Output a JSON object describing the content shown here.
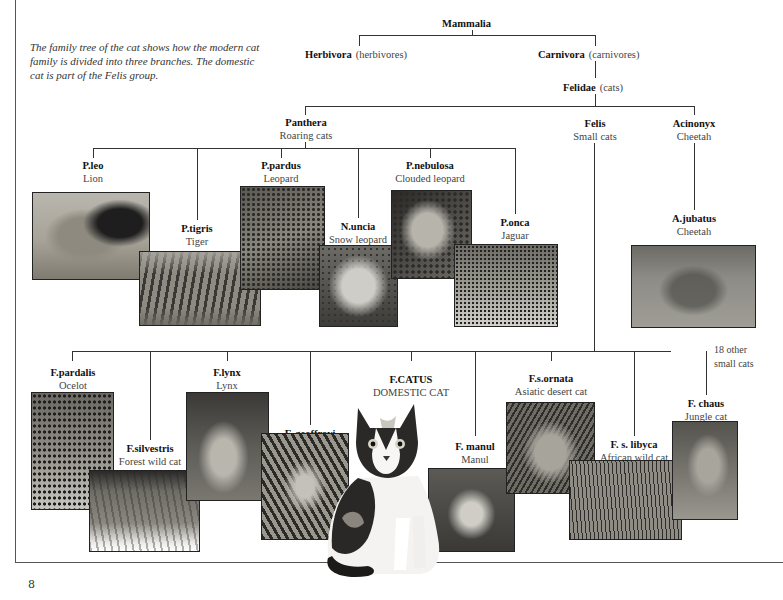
{
  "page": {
    "page_number": "8",
    "intro_text": "The family tree of the cat shows how the modern cat family is divided into three branches. The domestic cat is part of the Felis group."
  },
  "tree": {
    "root": {
      "sci": "Mammalia"
    },
    "herbivora": {
      "sci": "Herbivora",
      "common": "(herbivores)"
    },
    "carnivora": {
      "sci": "Carnivora",
      "common": "(carnivores)"
    },
    "felidae": {
      "sci": "Felidae",
      "common": "(cats)"
    },
    "panthera": {
      "sci": "Panthera",
      "common": "Roaring cats"
    },
    "felis": {
      "sci": "Felis",
      "common": "Small cats"
    },
    "acinonyx": {
      "sci": "Acinonyx",
      "common": "Cheetah"
    },
    "panthera_species": [
      {
        "sci": "P.leo",
        "common": "Lion",
        "photo": "lion-photo"
      },
      {
        "sci": "P.tigris",
        "common": "Tiger",
        "photo": "tiger-photo"
      },
      {
        "sci": "P.pardus",
        "common": "Leopard",
        "photo": "leopard-photo"
      },
      {
        "sci": "N.uncia",
        "common": "Snow leopard",
        "photo": "snow-leopard-photo"
      },
      {
        "sci": "P.nebulosa",
        "common": "Clouded leopard",
        "photo": "clouded-leopard-photo"
      },
      {
        "sci": "P.onca",
        "common": "Jaguar",
        "photo": "jaguar-photo"
      }
    ],
    "acinonyx_species": [
      {
        "sci": "A.jubatus",
        "common": "Cheetah",
        "photo": "cheetah-photo"
      }
    ],
    "felis_species": [
      {
        "sci": "F.pardalis",
        "common": "Ocelot",
        "photo": "ocelot-photo"
      },
      {
        "sci": "F.silvestris",
        "common": "Forest wild cat",
        "photo": "forest-wild-cat-photo"
      },
      {
        "sci": "F.lynx",
        "common": "Lynx",
        "photo": "lynx-photo"
      },
      {
        "sci": "F. geoffroyi",
        "common": "Geoffroy's cat",
        "photo": "geoffroys-cat-photo"
      },
      {
        "sci": "F.CATUS",
        "common": "DOMESTIC CAT",
        "photo": "domestic-cat-photo"
      },
      {
        "sci": "F. manul",
        "common": "Manul",
        "photo": "manul-photo"
      },
      {
        "sci": "F.s.ornata",
        "common": "Asiatic desert cat",
        "photo": "asiatic-desert-cat-photo"
      },
      {
        "sci": "F. s. libyca",
        "common": "African wild cat",
        "photo": "african-wild-cat-photo"
      },
      {
        "sci": "F. chaus",
        "common": "Jungle cat",
        "photo": "jungle-cat-photo"
      }
    ],
    "other_note_line1": "18 other",
    "other_note_line2": "small cats"
  },
  "colors": {
    "line": "#333333",
    "text": "#111111",
    "subtext": "#444444"
  }
}
